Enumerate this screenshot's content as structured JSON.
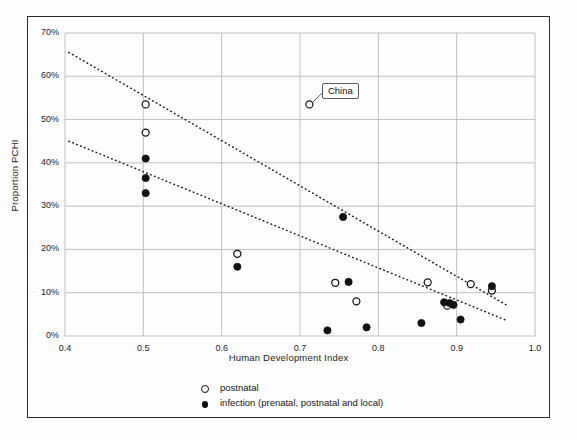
{
  "chart_data": {
    "type": "scatter",
    "title": "",
    "xlabel": "Human Development  Index",
    "ylabel": "Proportion PCHI",
    "xlim": [
      0.4,
      1.0
    ],
    "ylim": [
      0,
      0.7
    ],
    "xticks": [
      "0.4",
      "0.5",
      "0.6",
      "0.7",
      "0.8",
      "0.9",
      "1.0"
    ],
    "xtick_values": [
      0.4,
      0.5,
      0.6,
      0.7,
      0.8,
      0.9,
      1.0
    ],
    "yticks": [
      "0%",
      "10%",
      "20%",
      "30%",
      "40%",
      "50%",
      "60%",
      "70%"
    ],
    "ytick_values": [
      0,
      10,
      20,
      30,
      40,
      50,
      60,
      70
    ],
    "grid": true,
    "grid_color": "#b9b9b9",
    "legend_position": "below-plot",
    "series": [
      {
        "name": "postnatal",
        "marker": "open-circle",
        "color": "#111111",
        "points": [
          {
            "x": 0.503,
            "y": 53.5,
            "label": "China"
          },
          {
            "x": 0.503,
            "y": 47.0
          },
          {
            "x": 0.62,
            "y": 19.0
          },
          {
            "x": 0.712,
            "y": 53.5,
            "label": "China"
          },
          {
            "x": 0.745,
            "y": 12.3
          },
          {
            "x": 0.772,
            "y": 8.0
          },
          {
            "x": 0.863,
            "y": 12.4
          },
          {
            "x": 0.888,
            "y": 7.0
          },
          {
            "x": 0.918,
            "y": 12.0
          },
          {
            "x": 0.945,
            "y": 10.5
          }
        ]
      },
      {
        "name": "infection (prenatal, postnatal and local)",
        "marker": "filled-circle",
        "color": "#111111",
        "points": [
          {
            "x": 0.503,
            "y": 41.0
          },
          {
            "x": 0.503,
            "y": 36.5
          },
          {
            "x": 0.503,
            "y": 33.0
          },
          {
            "x": 0.62,
            "y": 16.0
          },
          {
            "x": 0.735,
            "y": 1.3
          },
          {
            "x": 0.755,
            "y": 27.5
          },
          {
            "x": 0.762,
            "y": 12.5
          },
          {
            "x": 0.785,
            "y": 2.0
          },
          {
            "x": 0.855,
            "y": 3.0
          },
          {
            "x": 0.884,
            "y": 7.8
          },
          {
            "x": 0.891,
            "y": 7.6
          },
          {
            "x": 0.896,
            "y": 7.2
          },
          {
            "x": 0.905,
            "y": 3.8
          },
          {
            "x": 0.945,
            "y": 11.5
          }
        ]
      }
    ],
    "trendlines": [
      {
        "name": "upper-trend",
        "style": "dotted",
        "x0": 0.405,
        "y0": 65.5,
        "x1": 0.965,
        "y1": 7.0
      },
      {
        "name": "lower-trend",
        "style": "dotted",
        "x0": 0.405,
        "y0": 45.0,
        "x1": 0.965,
        "y1": 3.5
      }
    ],
    "annotations": [
      {
        "name": "china-callout",
        "text": "China",
        "point_x": 0.712,
        "point_y": 53.5,
        "box_x": 0.728,
        "box_y": 57.0
      }
    ]
  },
  "legend": {
    "entries": [
      {
        "marker": "open-circle",
        "label": "postnatal"
      },
      {
        "marker": "filled-circle",
        "label": "infection (prenatal, postnatal and local)"
      }
    ]
  }
}
